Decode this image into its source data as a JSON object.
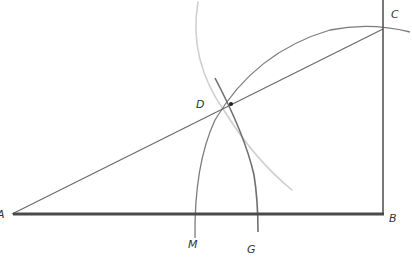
{
  "diagram": {
    "type": "geometric construction",
    "colors": {
      "background": "#ffffff",
      "thick_line": "#4a4a4a",
      "thin_line": "#6e6e6e",
      "arc": "#7a7a7a",
      "faint_arc": "#c8c8c8",
      "point": "#222222"
    },
    "points": {
      "A": {
        "label": "A",
        "x": 12,
        "y": 214
      },
      "B": {
        "label": "B",
        "x": 383,
        "y": 214
      },
      "C": {
        "label": "C",
        "x": 383,
        "y": 29
      },
      "D": {
        "label": "D",
        "x": 231,
        "y": 104
      },
      "M": {
        "label": "M",
        "x": 195,
        "y": 214
      },
      "G": {
        "label": "G",
        "x": 257,
        "y": 214
      }
    },
    "labels": {
      "A": "A",
      "B": "B",
      "C": "C",
      "D": "D",
      "M": "M",
      "G": "G"
    },
    "segments": [
      {
        "from": "A",
        "to": "B",
        "style": "thick"
      },
      {
        "from": "B",
        "to": "C",
        "style": "medium"
      },
      {
        "from": "A",
        "to": "C",
        "style": "thin"
      }
    ],
    "arcs": [
      {
        "name": "arc-CM",
        "center": "B",
        "note": "arc from C to M"
      },
      {
        "name": "arc-G",
        "center": "A",
        "note": "arc through D to G"
      },
      {
        "name": "arc-faint",
        "center": "C",
        "note": "faint construction arc through D"
      }
    ]
  }
}
